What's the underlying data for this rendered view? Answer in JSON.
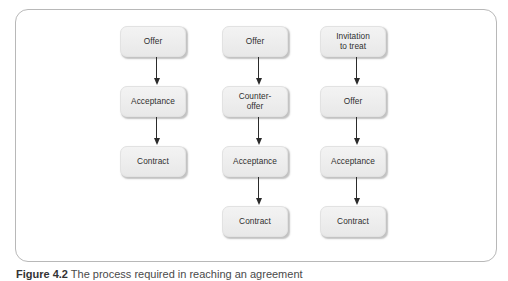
{
  "figure": {
    "caption_number": "Figure 4.2",
    "caption_text": "The process required in reaching an agreement",
    "frame_border_color": "#b8b8b8",
    "node_fill_color": "#eeeeee",
    "node_text_color": "#2f2f2f",
    "arrow_color": "#2b2b2b",
    "background_color": "#ffffff"
  },
  "chart_data": {
    "type": "diagram",
    "title": "The process required in reaching an agreement",
    "orientation": "top-to-bottom",
    "columns": [
      {
        "name": "simple-offer-acceptance",
        "nodes": [
          "Offer",
          "Acceptance",
          "Contract"
        ]
      },
      {
        "name": "counter-offer-sequence",
        "nodes": [
          "Offer",
          "Counter-\noffer",
          "Acceptance",
          "Contract"
        ]
      },
      {
        "name": "invitation-to-treat-sequence",
        "nodes": [
          "Invitation\nto treat",
          "Offer",
          "Acceptance",
          "Contract"
        ]
      }
    ]
  },
  "columns": [
    {
      "id": "column-1",
      "nodes": [
        {
          "label": "Offer"
        },
        {
          "label": "Acceptance"
        },
        {
          "label": "Contract"
        }
      ]
    },
    {
      "id": "column-2",
      "nodes": [
        {
          "label": "Offer"
        },
        {
          "label": "Counter-\noffer"
        },
        {
          "label": "Acceptance"
        },
        {
          "label": "Contract"
        }
      ]
    },
    {
      "id": "column-3",
      "nodes": [
        {
          "label": "Invitation\nto treat"
        },
        {
          "label": "Offer"
        },
        {
          "label": "Acceptance"
        },
        {
          "label": "Contract"
        }
      ]
    }
  ]
}
